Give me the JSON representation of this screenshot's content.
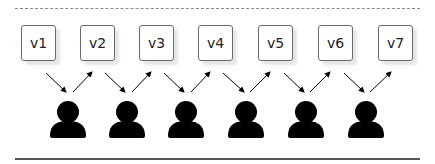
{
  "diagram": {
    "nodes": [
      {
        "id": "v1",
        "label": "v1"
      },
      {
        "id": "v2",
        "label": "v2"
      },
      {
        "id": "v3",
        "label": "v3"
      },
      {
        "id": "v4",
        "label": "v4"
      },
      {
        "id": "v5",
        "label": "v5"
      },
      {
        "id": "v6",
        "label": "v6"
      },
      {
        "id": "v7",
        "label": "v7"
      }
    ],
    "users": 6,
    "edges": [
      {
        "from": "v1",
        "to": "user1"
      },
      {
        "from": "user1",
        "to": "v2"
      },
      {
        "from": "v2",
        "to": "user2"
      },
      {
        "from": "user2",
        "to": "v3"
      },
      {
        "from": "v3",
        "to": "user3"
      },
      {
        "from": "user3",
        "to": "v4"
      },
      {
        "from": "v4",
        "to": "user4"
      },
      {
        "from": "user4",
        "to": "v5"
      },
      {
        "from": "v5",
        "to": "user5"
      },
      {
        "from": "user5",
        "to": "v6"
      },
      {
        "from": "v6",
        "to": "user6"
      },
      {
        "from": "user6",
        "to": "v7"
      }
    ],
    "colors": {
      "box_border": "#6a6a6a",
      "user": "#000000",
      "arrow": "#000000"
    }
  }
}
